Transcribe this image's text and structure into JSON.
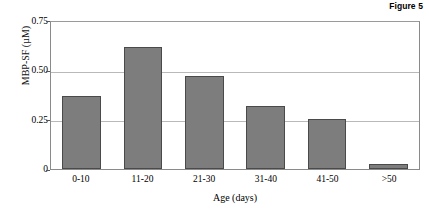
{
  "figure": {
    "label": "Figure 5"
  },
  "chart_data": {
    "type": "bar",
    "title": "Figure 5",
    "xlabel": "Age (days)",
    "ylabel": "MBP-SF (µM)",
    "categories": [
      "0-10",
      "11-20",
      "21-30",
      "31-40",
      "41-50",
      ">50"
    ],
    "values": [
      0.37,
      0.62,
      0.475,
      0.32,
      0.255,
      0.025
    ],
    "ylim": [
      0,
      0.75
    ],
    "ytick_labels": [
      "0.75",
      "0.50",
      "0.25",
      "0"
    ],
    "ytick_values": [
      0.75,
      0.5,
      0.25,
      0
    ],
    "grid": true,
    "grid_axis": "y",
    "legend": false,
    "legend_position": "none",
    "bar_color": "#7d7d7d",
    "bar_edge_color": "#4a4a4a",
    "grid_color": "#b9b9b9",
    "axis_color": "#8a8a8a"
  }
}
